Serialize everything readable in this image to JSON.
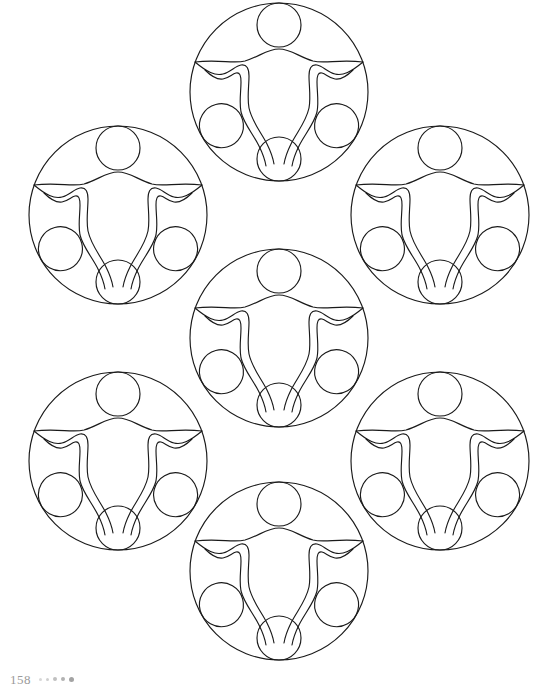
{
  "page": {
    "kind": "coloring-book-page",
    "background_color": "#ffffff",
    "width": 558,
    "height": 695
  },
  "footer": {
    "folio": "158",
    "dots": [
      "dot-1",
      "dot-2",
      "dot-3",
      "dot-4",
      "dot-5"
    ],
    "folio_color": "#9a9a9a"
  },
  "artwork": {
    "title": "",
    "stroke_color": "#1a1a1a",
    "stroke_width": 1.15,
    "fill": "none",
    "unit_radius": 89,
    "small_circle_radius": 22,
    "units": [
      {
        "name": "unit-top",
        "cx": 279,
        "cy": 92
      },
      {
        "name": "unit-upper-left",
        "cx": 118,
        "cy": 215
      },
      {
        "name": "unit-upper-right",
        "cx": 440,
        "cy": 215
      },
      {
        "name": "unit-center",
        "cx": 279,
        "cy": 338
      },
      {
        "name": "unit-lower-left",
        "cx": 118,
        "cy": 461
      },
      {
        "name": "unit-lower-right",
        "cx": 440,
        "cy": 461
      },
      {
        "name": "unit-bottom",
        "cx": 279,
        "cy": 571
      }
    ]
  }
}
